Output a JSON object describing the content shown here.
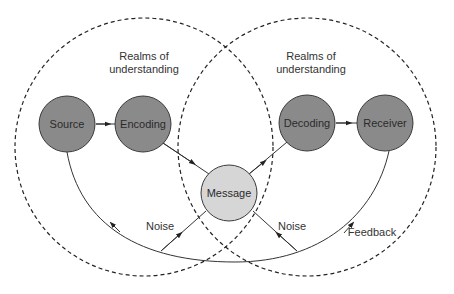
{
  "diagram": {
    "type": "communication-model",
    "colors": {
      "node_fill": "#8a8a8a",
      "node_stroke": "#3a3a3a",
      "message_fill": "#d6d6d6",
      "line": "#333333",
      "dashed_circle": "#222222",
      "text": "#333333",
      "background": "#ffffff"
    },
    "realms": [
      {
        "id": "sender-realm",
        "label_line1": "Realms of",
        "label_line2": "understanding"
      },
      {
        "id": "receiver-realm",
        "label_line1": "Realms of",
        "label_line2": "understanding"
      }
    ],
    "nodes": {
      "source": "Source",
      "encoding": "Encoding",
      "message": "Message",
      "decoding": "Decoding",
      "receiver": "Receiver"
    },
    "edges": [
      {
        "from": "Source",
        "to": "Encoding"
      },
      {
        "from": "Encoding",
        "to": "Message"
      },
      {
        "from": "Message",
        "to": "Decoding"
      },
      {
        "from": "Decoding",
        "to": "Receiver"
      },
      {
        "from": "Receiver",
        "to": "Source",
        "label": "Feedback"
      },
      {
        "from": "feedback-loop",
        "to": "Message",
        "label": "Noise"
      },
      {
        "from": "Message",
        "to": "feedback-loop",
        "label": "Noise"
      }
    ],
    "labels": {
      "noise_left": "Noise",
      "noise_right": "Noise",
      "feedback": "Feedback"
    }
  }
}
